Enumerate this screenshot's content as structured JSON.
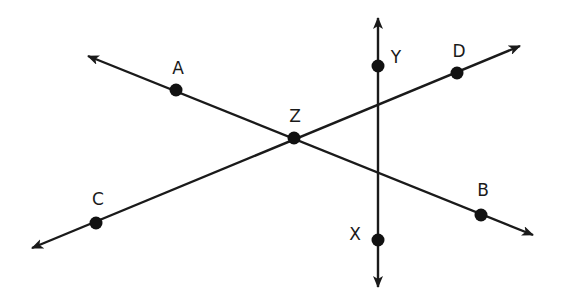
{
  "diagram": {
    "colors": {
      "stroke": "#1a1a1a",
      "point": "#111111",
      "background": "#ffffff"
    },
    "lines": [
      {
        "id": "AB",
        "from": [
          88,
          56
        ],
        "to": [
          533,
          235
        ],
        "arrows": "both"
      },
      {
        "id": "CD",
        "from": [
          32,
          248
        ],
        "to": [
          520,
          46
        ],
        "arrows": "both"
      },
      {
        "id": "XY",
        "from": [
          378,
          18
        ],
        "to": [
          378,
          287
        ],
        "arrows": "both"
      }
    ],
    "points": [
      {
        "name": "A",
        "x": 176,
        "y": 90,
        "label_x": 178,
        "label_y": 68
      },
      {
        "name": "Z",
        "x": 294,
        "y": 138,
        "label_x": 295,
        "label_y": 116
      },
      {
        "name": "B",
        "x": 481,
        "y": 215,
        "label_x": 483,
        "label_y": 190
      },
      {
        "name": "C",
        "x": 96,
        "y": 223,
        "label_x": 98,
        "label_y": 199
      },
      {
        "name": "D",
        "x": 457,
        "y": 73,
        "label_x": 459,
        "label_y": 51
      },
      {
        "name": "Y",
        "x": 378,
        "y": 66,
        "label_x": 396,
        "label_y": 57
      },
      {
        "name": "X",
        "x": 378,
        "y": 240,
        "label_x": 355,
        "label_y": 234
      }
    ]
  },
  "labels": {
    "A": "A",
    "Z": "Z",
    "B": "B",
    "C": "C",
    "D": "D",
    "Y": "Y",
    "X": "X"
  }
}
